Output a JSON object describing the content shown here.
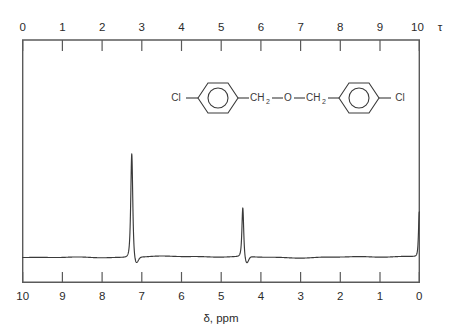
{
  "figure": {
    "kind": "nmr-spectrum",
    "background_color": "#ffffff",
    "trace_color": "#3a3a3a",
    "frame_color": "#5a5a5a"
  },
  "top_axis": {
    "name": "τ",
    "direction": "left-to-right-increasing",
    "min": 0,
    "max": 10,
    "ticks": [
      "0",
      "1",
      "2",
      "3",
      "4",
      "5",
      "6",
      "7",
      "8",
      "9",
      "10"
    ]
  },
  "bottom_axis": {
    "caption": "δ, ppm",
    "name": "δ",
    "unit": "ppm",
    "direction": "left-to-right-decreasing",
    "min": 0,
    "max": 10,
    "ticks": [
      "10",
      "9",
      "8",
      "7",
      "6",
      "5",
      "4",
      "3",
      "2",
      "1",
      "0"
    ]
  },
  "structure": {
    "name": "bis(4-chlorobenzyl) ether",
    "left_chlorine": "Cl",
    "left_ch2": "CH",
    "left_ch2_sub": "2",
    "oxygen": "O",
    "right_ch2": "CH",
    "right_ch2_sub": "2",
    "right_chlorine": "Cl",
    "bond_dash": "—"
  },
  "chart_data": {
    "type": "line",
    "title": "",
    "xlabel": "δ, ppm",
    "ylabel": "",
    "xlim": [
      10,
      0
    ],
    "ylim": [
      0,
      1
    ],
    "grid": false,
    "legend": "none",
    "x_axis_reversed": true,
    "secondary_x_axis": {
      "label": "τ",
      "xlim": [
        0,
        10
      ]
    },
    "peaks": [
      {
        "label": "aromatic H (C6H4)",
        "ppm": 7.25,
        "tau": 2.75,
        "relative_height": 0.655,
        "half_width_ppm": 0.045,
        "assignment": "8H aromatic"
      },
      {
        "label": "methylene CH2",
        "ppm": 4.45,
        "tau": 5.55,
        "relative_height": 0.31,
        "half_width_ppm": 0.04,
        "assignment": "4H, CH2-O-CH2"
      },
      {
        "label": "TMS reference",
        "ppm": 0.0,
        "tau": 10.0,
        "relative_height": 0.285,
        "half_width_ppm": 0.035,
        "assignment": "internal standard"
      }
    ],
    "baseline_level": 0.0
  }
}
